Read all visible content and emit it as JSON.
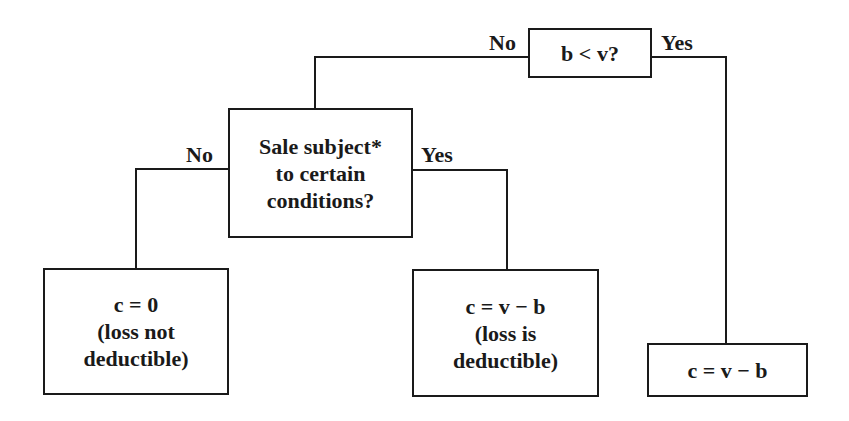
{
  "diagram": {
    "type": "decision-tree",
    "root": {
      "question": "b < v?",
      "no_label": "No",
      "yes_label": "Yes"
    },
    "middle": {
      "lines": [
        "Sale subject*",
        "to certain",
        "conditions?"
      ],
      "no_label": "No",
      "yes_label": "Yes"
    },
    "leaves": {
      "left": {
        "lines": [
          "c = 0",
          "(loss not",
          "deductible)"
        ]
      },
      "middle": {
        "lines": [
          "c = v − b",
          "(loss is",
          "deductible)"
        ]
      },
      "right": {
        "lines": [
          "c = v − b"
        ]
      }
    },
    "colors": {
      "stroke": "#1a1a1a",
      "background": "#ffffff"
    }
  }
}
